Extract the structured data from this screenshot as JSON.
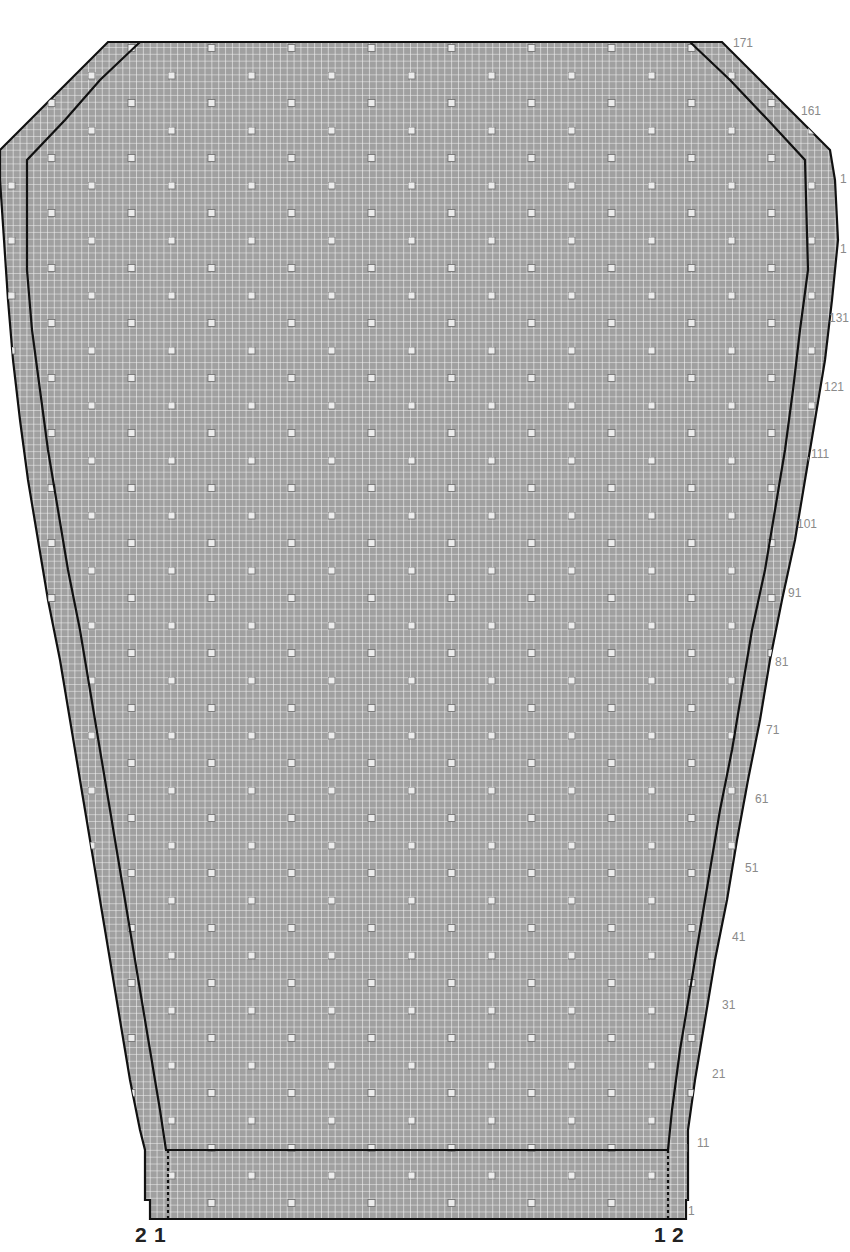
{
  "diagram": {
    "type": "knitting-chart",
    "colors": {
      "background": "#ffffff",
      "grid_fill": "#a0a0a0",
      "grid_line": "#f2f2f2",
      "outline": "#111111",
      "dot_fill": "#ececec",
      "dot_border": "#6a6a6a",
      "row_label": "#8a8a8a"
    },
    "row_labels": [
      {
        "text": "171",
        "x": 733,
        "y": 37
      },
      {
        "text": "161",
        "x": 801,
        "y": 105
      },
      {
        "text": "1",
        "x": 840,
        "y": 173
      },
      {
        "text": "1",
        "x": 840,
        "y": 243
      },
      {
        "text": "131",
        "x": 829,
        "y": 312
      },
      {
        "text": "121",
        "x": 824,
        "y": 381
      },
      {
        "text": "111",
        "x": 811,
        "y": 448
      },
      {
        "text": "101",
        "x": 797,
        "y": 518
      },
      {
        "text": "91",
        "x": 788,
        "y": 587
      },
      {
        "text": "81",
        "x": 775,
        "y": 656
      },
      {
        "text": "71",
        "x": 766,
        "y": 724
      },
      {
        "text": "61",
        "x": 755,
        "y": 793
      },
      {
        "text": "51",
        "x": 745,
        "y": 862
      },
      {
        "text": "41",
        "x": 732,
        "y": 931
      },
      {
        "text": "31",
        "x": 722,
        "y": 999
      },
      {
        "text": "21",
        "x": 712,
        "y": 1068
      },
      {
        "text": "11",
        "x": 697,
        "y": 1137
      },
      {
        "text": "1",
        "x": 688,
        "y": 1205
      }
    ],
    "size_labels_left": [
      {
        "text": "2",
        "x": 135,
        "y": 1224
      },
      {
        "text": "1",
        "x": 154,
        "y": 1224
      }
    ],
    "size_labels_right": [
      {
        "text": "1",
        "x": 654,
        "y": 1224
      },
      {
        "text": "2",
        "x": 672,
        "y": 1224
      }
    ]
  }
}
